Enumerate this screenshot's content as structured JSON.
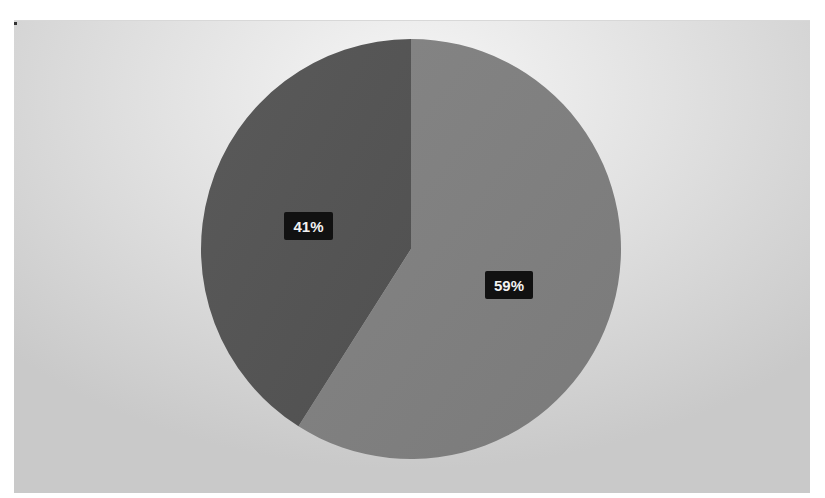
{
  "chart_data": {
    "type": "pie",
    "title": "",
    "categories": [
      "Slice A",
      "Slice B"
    ],
    "values": [
      59,
      41
    ],
    "labels": [
      "59%",
      "41%"
    ],
    "colors": [
      "#7f7f7f",
      "#555555"
    ],
    "start_angle_deg": 0,
    "direction": "clockwise",
    "legend": "none visible (cut off at bottom)",
    "data_label_style": "white bold text on black box"
  },
  "labels": {
    "slice_a": "59%",
    "slice_b": "41%"
  },
  "colors": {
    "slice_a": "#7f7f7f",
    "slice_b": "#555555",
    "label_bg": "#111111",
    "label_text": "#f2f2f2"
  }
}
